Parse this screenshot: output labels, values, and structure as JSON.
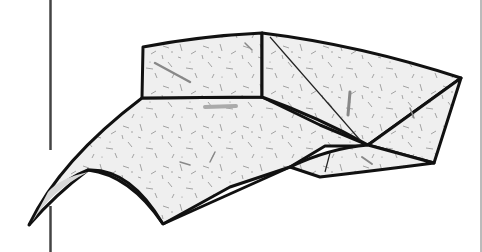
{
  "figure": {
    "colors": {
      "background": "#ffffff",
      "paper": "#ececec",
      "outline": "#111111",
      "fiber": "#8a8a8a",
      "frame_line": "#444444"
    }
  }
}
